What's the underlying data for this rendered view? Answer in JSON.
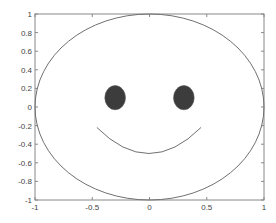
{
  "chart_data": {
    "type": "line",
    "title": "",
    "xlabel": "",
    "ylabel": "",
    "xlim": [
      -1,
      1
    ],
    "ylim": [
      -1,
      1
    ],
    "grid": false,
    "legend": null,
    "x_ticks": [
      -1,
      -0.5,
      0,
      0.5,
      1
    ],
    "x_tick_labels": [
      "-1",
      "-0.5",
      "0",
      "0.5",
      "1"
    ],
    "y_ticks": [
      -1,
      -0.8,
      -0.6,
      -0.4,
      -0.2,
      0,
      0.2,
      0.4,
      0.6,
      0.8,
      1
    ],
    "y_tick_labels": [
      "-1",
      "-0.8",
      "-0.6",
      "-0.4",
      "-0.2",
      "0",
      "0.2",
      "0.4",
      "0.6",
      "0.8",
      "1"
    ],
    "series": [
      {
        "name": "face",
        "shape": "ellipse",
        "center": [
          0,
          0
        ],
        "radii": [
          1,
          1
        ],
        "style": "line",
        "color": "#707070"
      },
      {
        "name": "left-eye",
        "shape": "filled-ellipse",
        "center": [
          -0.3,
          0.1
        ],
        "radii": [
          0.09,
          0.13
        ],
        "color": "#3c3c3c"
      },
      {
        "name": "right-eye",
        "shape": "filled-ellipse",
        "center": [
          0.3,
          0.1
        ],
        "radii": [
          0.09,
          0.13
        ],
        "color": "#3c3c3c"
      },
      {
        "name": "smile",
        "shape": "arc",
        "x_range": [
          -0.46,
          0.45
        ],
        "y_end": -0.22,
        "y_min": -0.5,
        "style": "line",
        "color": "#707070"
      }
    ]
  },
  "colors": {
    "axis": "#888888",
    "line": "#707070",
    "eye": "#3c3c3c",
    "text": "#444444"
  }
}
